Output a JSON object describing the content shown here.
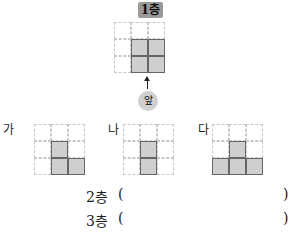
{
  "top_view": {
    "label": "1층",
    "front_label": "앞",
    "grid_size": [
      3,
      3
    ],
    "filled_cells": [
      [
        1,
        1
      ],
      [
        1,
        2
      ],
      [
        2,
        1
      ],
      [
        2,
        2
      ]
    ]
  },
  "options": [
    {
      "label": "가",
      "grid_size": [
        3,
        3
      ],
      "filled_cells": [
        [
          1,
          1
        ],
        [
          2,
          1
        ],
        [
          2,
          2
        ]
      ]
    },
    {
      "label": "나",
      "grid_size": [
        3,
        3
      ],
      "filled_cells": [
        [
          1,
          1
        ],
        [
          2,
          1
        ]
      ]
    },
    {
      "label": "다",
      "grid_size": [
        3,
        3
      ],
      "filled_cells": [
        [
          1,
          1
        ],
        [
          2,
          0
        ],
        [
          2,
          1
        ],
        [
          2,
          2
        ]
      ]
    }
  ],
  "answers": [
    {
      "label": "2층",
      "open": "(",
      "close": ")",
      "value": ""
    },
    {
      "label": "3층",
      "open": "(",
      "close": ")",
      "value": ""
    }
  ],
  "colors": {
    "filled": "#cfcfcf",
    "filled_border": "#666666",
    "grid_line": "#c8c8c8",
    "badge": "#9a9a9a"
  }
}
